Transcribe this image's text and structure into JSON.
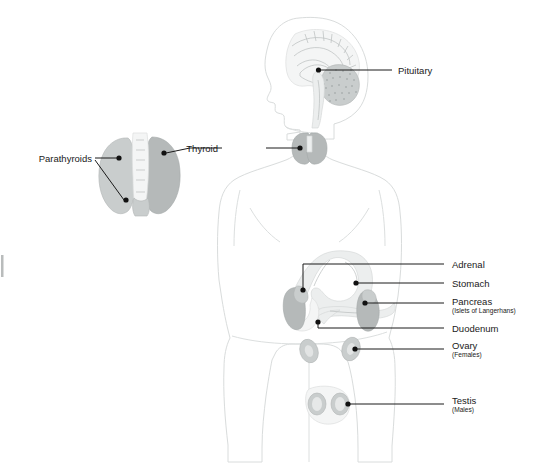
{
  "figure": {
    "background_color": "#ffffff",
    "label_color": "#1a1a1a",
    "organ_gray": "#b5b9b9",
    "outline_gray": "#d9dcdc"
  },
  "labels": {
    "pituitary": "Pituitary",
    "thyroid": "Thyroid",
    "parathyroids": "Parathyroids",
    "adrenal": "Adrenal",
    "stomach": "Stomach",
    "pancreas": "Pancreas",
    "pancreas_sub": "(Islets of Langerhans)",
    "duodenum": "Duodenum",
    "ovary": "Ovary",
    "ovary_sub": "(Females)",
    "testis": "Testis",
    "testis_sub": "(Males)"
  }
}
